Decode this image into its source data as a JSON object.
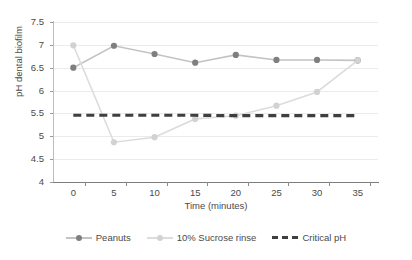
{
  "chart_data": {
    "type": "line",
    "title": "",
    "xlabel": "Time (minutes)",
    "ylabel": "pH dental biofilm",
    "x": [
      0,
      5,
      10,
      15,
      20,
      25,
      30,
      35
    ],
    "xlim": [
      -2.5,
      37.5
    ],
    "ylim": [
      4,
      7.5
    ],
    "xticks": [
      "0",
      "5",
      "10",
      "15",
      "20",
      "25",
      "30",
      "35"
    ],
    "yticks": [
      "4",
      "4.5",
      "5",
      "5.5",
      "6",
      "6.5",
      "7",
      "7.5"
    ],
    "grid": true,
    "legend_position": "bottom",
    "series": [
      {
        "name": "Peanuts",
        "color": "#7f7f7f",
        "line_color": "#c3c3c3",
        "style": "solid",
        "marker": "circle",
        "values": [
          6.5,
          6.98,
          6.8,
          6.61,
          6.78,
          6.67,
          6.67,
          6.66
        ]
      },
      {
        "name": "10% Sucrose rinse",
        "color": "#d2d2d2",
        "line_color": "#dcdcdc",
        "style": "solid",
        "marker": "circle",
        "values": [
          6.99,
          4.87,
          4.98,
          5.38,
          5.45,
          5.67,
          5.97,
          6.66
        ]
      },
      {
        "name": "Critical pH",
        "color": "#3f3f3f",
        "line_color": "#3f3f3f",
        "style": "dashed",
        "marker": "none",
        "values": [
          5.46,
          5.46,
          5.46,
          5.46,
          5.45,
          5.45,
          5.45,
          5.45
        ]
      }
    ]
  },
  "legend": {
    "items": [
      {
        "label": "Peanuts"
      },
      {
        "label": "10% Sucrose rinse"
      },
      {
        "label": "Critical pH"
      }
    ]
  }
}
